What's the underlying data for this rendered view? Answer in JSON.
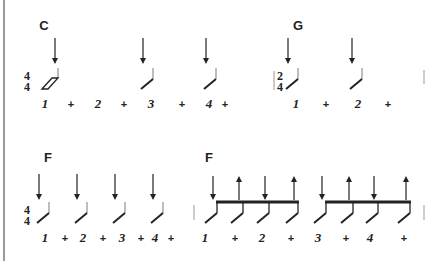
{
  "title": "Strumming pattern diagram",
  "colors": {
    "ink": "#222222",
    "stem": "#999999",
    "rule": "#9a9a9a",
    "bar": "#aaaaaa"
  },
  "systems": [
    {
      "id": "system-1",
      "time_signature": {
        "top": "4",
        "bottom": "4"
      },
      "chords": [
        {
          "label": "C",
          "x": 44
        },
        {
          "label": "G",
          "x": 298
        }
      ],
      "second_time_signature": {
        "top": "2",
        "bottom": "4",
        "x": 279
      },
      "strums": [
        {
          "x": 55,
          "dir": "down",
          "type": "whole-slash"
        },
        {
          "x": 153,
          "dir": "down",
          "type": "half-slash"
        },
        {
          "x": 216,
          "dir": "down",
          "type": "half-slash"
        },
        {
          "x": 298,
          "dir": "down",
          "type": "half-slash"
        },
        {
          "x": 362,
          "dir": "down",
          "type": "half-slash"
        }
      ],
      "counts": [
        {
          "text": "1",
          "x": 45
        },
        {
          "text": "+",
          "x": 71
        },
        {
          "text": "2",
          "x": 98
        },
        {
          "text": "+",
          "x": 124
        },
        {
          "text": "3",
          "x": 151
        },
        {
          "text": "+",
          "x": 182
        },
        {
          "text": "4",
          "x": 209
        },
        {
          "text": "+",
          "x": 225
        },
        {
          "text": "1",
          "x": 296
        },
        {
          "text": "+",
          "x": 326
        },
        {
          "text": "2",
          "x": 358
        },
        {
          "text": "+",
          "x": 388
        }
      ],
      "barlines": [
        424
      ]
    },
    {
      "id": "system-2",
      "time_signature": {
        "top": "4",
        "bottom": "4"
      },
      "chords": [
        {
          "label": "F",
          "x": 48
        },
        {
          "label": "F",
          "x": 209
        }
      ],
      "strums": [
        {
          "x": 49,
          "dir": "down",
          "type": "half-slash"
        },
        {
          "x": 87,
          "dir": "down",
          "type": "half-slash"
        },
        {
          "x": 125,
          "dir": "down",
          "type": "half-slash"
        },
        {
          "x": 163,
          "dir": "down",
          "type": "half-slash"
        }
      ],
      "beamed_groups": [
        {
          "strums": [
            {
              "x": 213,
              "dir": "down"
            },
            {
              "x": 239,
              "dir": "up"
            },
            {
              "x": 265,
              "dir": "down"
            },
            {
              "x": 294,
              "dir": "up"
            }
          ]
        },
        {
          "strums": [
            {
              "x": 322,
              "dir": "down"
            },
            {
              "x": 349,
              "dir": "up"
            },
            {
              "x": 374,
              "dir": "down"
            },
            {
              "x": 406,
              "dir": "up"
            }
          ]
        }
      ],
      "counts": [
        {
          "text": "1",
          "x": 45
        },
        {
          "text": "+",
          "x": 65
        },
        {
          "text": "2",
          "x": 83
        },
        {
          "text": "+",
          "x": 103
        },
        {
          "text": "3",
          "x": 122
        },
        {
          "text": "+",
          "x": 141
        },
        {
          "text": "4",
          "x": 155
        },
        {
          "text": "+",
          "x": 171
        },
        {
          "text": "1",
          "x": 205
        },
        {
          "text": "+",
          "x": 235
        },
        {
          "text": "2",
          "x": 262
        },
        {
          "text": "+",
          "x": 291
        },
        {
          "text": "3",
          "x": 318
        },
        {
          "text": "+",
          "x": 346
        },
        {
          "text": "4",
          "x": 370
        },
        {
          "text": "+",
          "x": 404
        }
      ],
      "barlines": [
        194,
        424
      ]
    }
  ]
}
